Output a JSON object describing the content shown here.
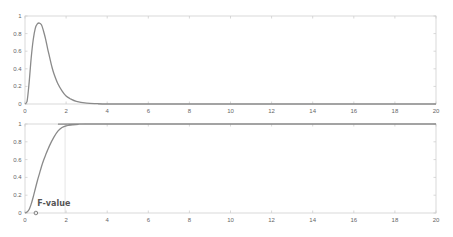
{
  "figure": {
    "width": 453,
    "height": 237,
    "colors": {
      "background": "#ffffff",
      "axes_box": "#cfcfcf",
      "tick": "#bdbdbd",
      "tick_label": "#666666",
      "curve": "#8a8a8a",
      "reference_line": "#dddddd",
      "marker": "#666666",
      "annotation": "#555555"
    }
  },
  "chart_data": [
    {
      "id": "pdf",
      "type": "line",
      "title": "",
      "xlabel": "",
      "ylabel": "",
      "xlim": [
        0,
        20
      ],
      "ylim": [
        0,
        1
      ],
      "grid": false,
      "box": true,
      "axes_px": {
        "left": 25,
        "right": 436,
        "top": 16,
        "bottom": 104
      },
      "x_ticks": [
        0,
        2,
        4,
        6,
        8,
        10,
        12,
        14,
        16,
        18,
        20
      ],
      "x_tick_labels": [
        "0",
        "2",
        "4",
        "6",
        "8",
        "10",
        "12",
        "14",
        "16",
        "18",
        "20"
      ],
      "y_ticks": [
        0,
        0.2,
        0.4,
        0.6,
        0.8,
        1
      ],
      "y_tick_labels": [
        "0",
        "0.2",
        "0.4",
        "0.6",
        "0.8",
        "1"
      ],
      "series": [
        {
          "name": "F-distribution PDF",
          "x": [
            0,
            0.1,
            0.2,
            0.3,
            0.4,
            0.5,
            0.6,
            0.7,
            0.8,
            0.9,
            1.0,
            1.1,
            1.2,
            1.3,
            1.4,
            1.6,
            1.8,
            2.0,
            2.2,
            2.5,
            3.0,
            3.5,
            4.0,
            5.0,
            20
          ],
          "y": [
            0,
            0.03,
            0.24,
            0.52,
            0.73,
            0.86,
            0.91,
            0.92,
            0.9,
            0.83,
            0.74,
            0.63,
            0.53,
            0.43,
            0.35,
            0.23,
            0.15,
            0.09,
            0.06,
            0.03,
            0.01,
            0.004,
            0.001,
            0,
            0
          ]
        }
      ]
    },
    {
      "id": "cdf",
      "type": "line",
      "title": "",
      "xlabel": "",
      "ylabel": "",
      "xlim": [
        0,
        20
      ],
      "ylim": [
        0,
        1
      ],
      "grid": false,
      "box": true,
      "axes_px": {
        "left": 25,
        "right": 436,
        "top": 124,
        "bottom": 213
      },
      "x_ticks": [
        0,
        2,
        4,
        6,
        8,
        10,
        12,
        14,
        16,
        18,
        20
      ],
      "x_tick_labels": [
        "0",
        "2",
        "4",
        "6",
        "8",
        "10",
        "12",
        "14",
        "16",
        "18",
        "20"
      ],
      "y_ticks": [
        0,
        0.2,
        0.4,
        0.6,
        0.8,
        1
      ],
      "y_tick_labels": [
        "0",
        "0.2",
        "0.4",
        "0.6",
        "0.8",
        "1"
      ],
      "series": [
        {
          "name": "F-distribution CDF",
          "x": [
            0,
            0.1,
            0.2,
            0.3,
            0.4,
            0.5,
            0.6,
            0.7,
            0.8,
            0.9,
            1.0,
            1.2,
            1.4,
            1.6,
            1.8,
            2.0,
            2.3,
            2.6,
            3.0,
            20
          ],
          "y": [
            0,
            0.01,
            0.04,
            0.1,
            0.18,
            0.27,
            0.36,
            0.44,
            0.52,
            0.59,
            0.65,
            0.76,
            0.85,
            0.92,
            0.96,
            0.98,
            0.99,
            0.997,
            1,
            1
          ]
        }
      ],
      "reference_line_x": 1.95,
      "marker": {
        "x": 0.53,
        "y": 0,
        "shape": "circle"
      },
      "annotations": [
        {
          "text": "F-value",
          "x": 0.6,
          "y": 0.08
        }
      ]
    }
  ]
}
